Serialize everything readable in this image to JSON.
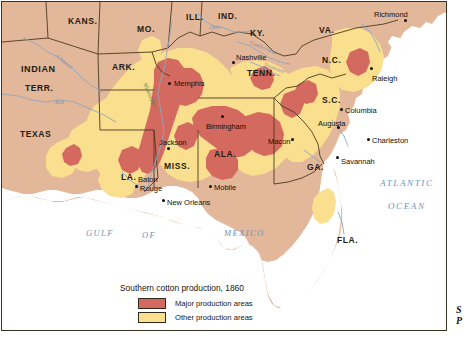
{
  "map": {
    "title": "Southern cotton production, 1860",
    "colors": {
      "land": "#e3b79a",
      "major_production": "#d4695f",
      "other_production": "#fadf8e",
      "water": "#ffffff",
      "border": "#3b3326",
      "state_line": "#4a3a22",
      "river": "#8fa6c0",
      "ocean_text": "#6e93bd"
    },
    "states": [
      {
        "name": "KANS.",
        "x": 66,
        "y": 14
      },
      {
        "name": "MO.",
        "x": 135,
        "y": 22
      },
      {
        "name": "ILL.",
        "x": 184,
        "y": 10
      },
      {
        "name": "IND.",
        "x": 216,
        "y": 9
      },
      {
        "name": "KY.",
        "x": 248,
        "y": 26
      },
      {
        "name": "VA.",
        "x": 317,
        "y": 23
      },
      {
        "name": "INDIAN",
        "x": 19,
        "y": 62
      },
      {
        "name": "TERR.",
        "x": 23,
        "y": 81
      },
      {
        "name": "ARK.",
        "x": 110,
        "y": 60
      },
      {
        "name": "TENN.",
        "x": 245,
        "y": 66
      },
      {
        "name": "N.C.",
        "x": 320,
        "y": 53
      },
      {
        "name": "TEXAS",
        "x": 18,
        "y": 127
      },
      {
        "name": "S.C.",
        "x": 320,
        "y": 93
      },
      {
        "name": "MISS.",
        "x": 162,
        "y": 159
      },
      {
        "name": "ALA.",
        "x": 212,
        "y": 147
      },
      {
        "name": "GA.",
        "x": 305,
        "y": 160
      },
      {
        "name": "LA.",
        "x": 119,
        "y": 170
      },
      {
        "name": "FLA.",
        "x": 335,
        "y": 233
      }
    ],
    "cities": [
      {
        "name": "Memphis",
        "lx": 172,
        "ly": 77,
        "dx": 166,
        "dy": 80,
        "anchor": "left"
      },
      {
        "name": "Nashville",
        "lx": 234,
        "ly": 51,
        "dx": 230,
        "dy": 59,
        "anchor": "left"
      },
      {
        "name": "Richmond",
        "lx": 372,
        "ly": 8,
        "dx": 402,
        "dy": 17,
        "anchor": "left"
      },
      {
        "name": "Raleigh",
        "lx": 370,
        "ly": 72,
        "dx": 368,
        "dy": 65,
        "anchor": "left"
      },
      {
        "name": "Columbia",
        "lx": 343,
        "ly": 104,
        "dx": 338,
        "dy": 106,
        "anchor": "left"
      },
      {
        "name": "Augusta",
        "lx": 316,
        "ly": 117,
        "dx": 335,
        "dy": 124,
        "anchor": "left"
      },
      {
        "name": "Charleston",
        "lx": 370,
        "ly": 134,
        "dx": 365,
        "dy": 136,
        "anchor": "left"
      },
      {
        "name": "Savannah",
        "lx": 339,
        "ly": 155,
        "dx": 334,
        "dy": 154,
        "anchor": "left"
      },
      {
        "name": "Birmingham",
        "lx": 204,
        "ly": 120,
        "dx": 219,
        "dy": 113,
        "anchor": "left"
      },
      {
        "name": "Macon",
        "lx": 266,
        "ly": 135,
        "dx": 289,
        "dy": 136,
        "anchor": "left"
      },
      {
        "name": "Jackson",
        "lx": 157,
        "ly": 136,
        "dx": 165,
        "dy": 145,
        "anchor": "left"
      },
      {
        "name": "Baton",
        "lx": 136,
        "ly": 173,
        "dx": 0,
        "dy": 0,
        "anchor": "none"
      },
      {
        "name": "Rouge",
        "lx": 138,
        "ly": 182,
        "dx": 133,
        "dy": 183,
        "anchor": "left"
      },
      {
        "name": "New Orleans",
        "lx": 165,
        "ly": 196,
        "dx": 160,
        "dy": 197,
        "anchor": "left"
      },
      {
        "name": "Mobile",
        "lx": 212,
        "ly": 181,
        "dx": 207,
        "dy": 183,
        "anchor": "left"
      }
    ],
    "water_labels": [
      {
        "text": "ATLANTIC",
        "x": 378,
        "y": 176,
        "kind": "ocean"
      },
      {
        "text": "OCEAN",
        "x": 386,
        "y": 199,
        "kind": "ocean"
      },
      {
        "text": "GULF",
        "x": 84,
        "y": 226,
        "kind": "gulf"
      },
      {
        "text": "OF",
        "x": 140,
        "y": 228,
        "kind": "gulf"
      },
      {
        "text": "MEXICO",
        "x": 222,
        "y": 226,
        "kind": "gulf"
      }
    ],
    "rivers": [
      {
        "text": "Arkansas",
        "x": 54,
        "y": 50,
        "rot": 38,
        "color": "blue"
      },
      {
        "text": "Red",
        "x": 53,
        "y": 97,
        "rot": 0,
        "color": "blue"
      },
      {
        "text": "Mississippi",
        "x": 143,
        "y": 78,
        "rot": 66,
        "color": "green"
      },
      {
        "text": "Ohio",
        "x": 207,
        "y": 23,
        "rot": -8,
        "color": "blue"
      },
      {
        "text": "Cumberland",
        "x": 248,
        "y": 37,
        "rot": 22,
        "color": "blue"
      },
      {
        "text": "Tennessee",
        "x": 262,
        "y": 59,
        "rot": 20,
        "color": "blue"
      }
    ],
    "legend": {
      "title": "Southern cotton production, 1860",
      "entries": [
        {
          "label": "Major production areas",
          "color": "#d4695f"
        },
        {
          "label": "Other production areas",
          "color": "#fadf8e"
        }
      ]
    }
  },
  "side_caption": {
    "line1": "S",
    "line2": "P"
  }
}
